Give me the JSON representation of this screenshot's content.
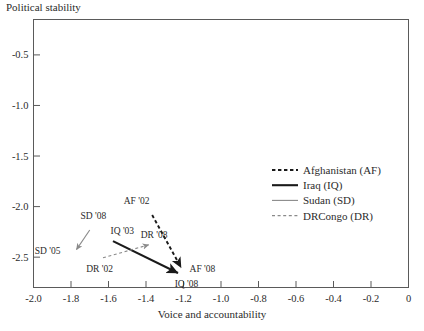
{
  "chart_data": {
    "type": "line",
    "title": "Political stability",
    "xlabel": "Voice and accountability",
    "ylabel": "Political stability",
    "xlim": [
      -2.0,
      0.0
    ],
    "ylim": [
      -2.8,
      -0.15
    ],
    "grid": false,
    "legend_position": "right",
    "xticks": [
      "-2.0",
      "-1.8",
      "-1.6",
      "-1.4",
      "-1.2",
      "-1.0",
      "-0.8",
      "-0.6",
      "-0.4",
      "-0.2",
      "0"
    ],
    "xtick_values": [
      -2.0,
      -1.8,
      -1.6,
      -1.4,
      -1.2,
      -1.0,
      -0.8,
      -0.6,
      -0.4,
      -0.2,
      0.0
    ],
    "yticks": [
      "-0.5",
      "-1.0",
      "-1.5",
      "-2.0",
      "-2.5"
    ],
    "ytick_values": [
      -0.5,
      -1.0,
      -1.5,
      -2.0,
      -2.5
    ],
    "series": [
      {
        "name": "Afghanistan (AF)",
        "code": "AF",
        "style": "dashed",
        "color": "#1a1a1a",
        "width": 1.9,
        "points": [
          {
            "label": "AF '02",
            "x": -1.38,
            "y": -2.04,
            "label_dx": -26,
            "label_dy": -7
          },
          {
            "label": "AF '08",
            "x": -1.205,
            "y": -2.63,
            "label_dx": 7,
            "label_dy": 2
          }
        ]
      },
      {
        "name": "Iraq (IQ)",
        "code": "IQ",
        "style": "solid",
        "color": "#1a1a1a",
        "width": 2.1,
        "points": [
          {
            "label": "IQ '03",
            "x": -1.6,
            "y": -2.32,
            "label_dx": 2,
            "label_dy": -5
          },
          {
            "label": "IQ '08",
            "x": -1.215,
            "y": -2.67,
            "label_dx": -6,
            "label_dy": 13
          }
        ]
      },
      {
        "name": "Sudan (SD)",
        "code": "SD",
        "style": "solid",
        "color": "#8a8a8a",
        "width": 1.1,
        "points": [
          {
            "label": "SD '08",
            "x": -1.685,
            "y": -2.19,
            "label_dx": -12,
            "label_dy": -7
          },
          {
            "label": "SD '05",
            "x": -1.78,
            "y": -2.45,
            "label_dx": -40,
            "label_dy": 2
          }
        ]
      },
      {
        "name": "DRCongo (DR)",
        "code": "DR",
        "style": "dashed",
        "color": "#8a8a8a",
        "width": 1.1,
        "points": [
          {
            "label": "DR '02",
            "x": -1.655,
            "y": -2.52,
            "label_dx": -12,
            "label_dy": 13
          },
          {
            "label": "DR '08",
            "x": -1.37,
            "y": -2.37,
            "label_dx": -11,
            "label_dy": -6
          }
        ]
      }
    ]
  },
  "legend": {
    "items": [
      {
        "label": "Afghanistan (AF)"
      },
      {
        "label": "Iraq (IQ)"
      },
      {
        "label": "Sudan (SD)"
      },
      {
        "label": "DRCongo (DR)"
      }
    ]
  }
}
